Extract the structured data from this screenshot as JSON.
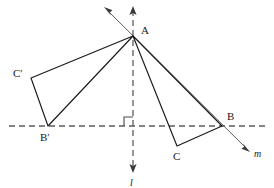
{
  "figure": {
    "canvas": {
      "width": 274,
      "height": 188,
      "background": "#ffffff"
    },
    "colors": {
      "stroke": "#1a1a1a",
      "axis": "#5c5c5c",
      "background": "#ffffff"
    }
  },
  "points": {
    "A": {
      "label": "A",
      "x": 133,
      "y": 36,
      "label_x": 141,
      "label_y": 34
    },
    "B": {
      "label": "B",
      "x": 222,
      "y": 126,
      "label_x": 227,
      "label_y": 120
    },
    "C": {
      "label": "C",
      "x": 177,
      "y": 146,
      "label_x": 175,
      "label_y": 160
    },
    "Bp": {
      "label": "B′",
      "x": 48,
      "y": 126,
      "label_x": 42,
      "label_y": 140
    },
    "Cp": {
      "label": "C′",
      "x": 31,
      "y": 78,
      "label_x": 14,
      "label_y": 76
    }
  },
  "lines": {
    "l": {
      "label": "l",
      "kind": "mirror-line",
      "orientation": "vertical",
      "x": 133,
      "y_top": 7,
      "y_bottom": 172,
      "label_x": 131,
      "label_y": 185,
      "arrow_top": true,
      "arrow_bottom": true,
      "dashed": true
    },
    "m": {
      "label": "m",
      "kind": "transversal",
      "x1": 105,
      "y1": 8,
      "x2": 250,
      "y2": 152,
      "label_x": 255,
      "label_y": 157,
      "arrow_start": true,
      "arrow_end": true
    },
    "horizontal": {
      "label": "",
      "kind": "base-line",
      "x_left": 9,
      "x_right": 266,
      "y": 126,
      "dashed": true
    }
  },
  "right_angle_marker": {
    "label": "right-angle",
    "x": 124,
    "y": 117,
    "size": 9
  },
  "triangles": [
    {
      "name": "ABC",
      "vertices": [
        "A",
        "C",
        "B"
      ]
    },
    {
      "name": "AB′C′",
      "vertices": [
        "A",
        "Cp",
        "Bp"
      ]
    }
  ]
}
